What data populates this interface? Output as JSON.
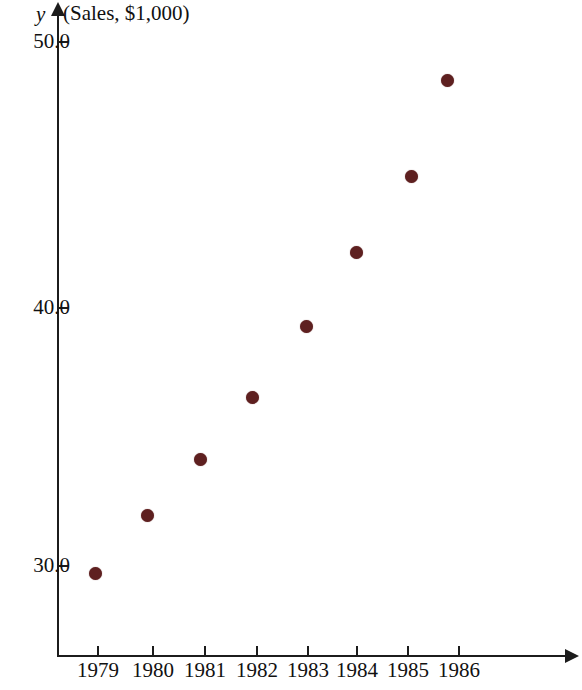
{
  "chart_data": {
    "type": "scatter",
    "title": "",
    "ylabel": "y (Sales, $1,000)",
    "ylabel_symbol": "y",
    "ylabel_text": "(Sales, $1,000)",
    "xlabel": "",
    "categories": [
      "1979",
      "1980",
      "1981",
      "1982",
      "1983",
      "1984",
      "1985",
      "1986"
    ],
    "x": [
      1979,
      1980,
      1981,
      1982,
      1983,
      1984,
      1985,
      1986
    ],
    "values": [
      29.7,
      31.9,
      34.1,
      36.5,
      39.2,
      42.0,
      44.9,
      48.5
    ],
    "series": [
      {
        "name": "Sales",
        "values": [
          29.7,
          31.9,
          34.1,
          36.5,
          39.2,
          42.0,
          44.9,
          48.5
        ]
      }
    ],
    "points": [
      {
        "label": "1979",
        "x": 1979,
        "y": 29.7,
        "px": 95,
        "py": 573
      },
      {
        "label": "1980",
        "x": 1980,
        "y": 31.9,
        "px": 147,
        "py": 515
      },
      {
        "label": "1981",
        "x": 1981,
        "y": 34.1,
        "px": 200,
        "py": 459
      },
      {
        "label": "1982",
        "x": 1982,
        "y": 36.5,
        "px": 252,
        "py": 397
      },
      {
        "label": "1983",
        "x": 1983,
        "y": 39.2,
        "px": 306,
        "py": 326
      },
      {
        "label": "1984",
        "x": 1984,
        "y": 42.0,
        "px": 356,
        "py": 252
      },
      {
        "label": "1985",
        "x": 1985,
        "y": 44.9,
        "px": 411,
        "py": 176
      },
      {
        "label": "1986",
        "x": 1986,
        "y": 48.5,
        "px": 447,
        "py": 80
      }
    ],
    "y_ticks": [
      {
        "label": "50.0",
        "value": 50.0,
        "py": 42
      },
      {
        "label": "40.0",
        "value": 40.0,
        "py": 308
      },
      {
        "label": "30.0",
        "value": 30.0,
        "py": 566
      }
    ],
    "x_ticks": [
      {
        "label": "1979",
        "px": 98
      },
      {
        "label": "1980",
        "px": 153
      },
      {
        "label": "1981",
        "px": 205
      },
      {
        "label": "1982",
        "px": 257
      },
      {
        "label": "1983",
        "px": 308
      },
      {
        "label": "1984",
        "px": 357
      },
      {
        "label": "1985",
        "px": 408
      },
      {
        "label": "1986",
        "px": 459
      }
    ],
    "ylim": [
      26.5,
      51.5
    ],
    "xlim": [
      1978.5,
      1987.5
    ],
    "grid": false,
    "legend": false,
    "marker_color": "#5e2020",
    "axis_color": "#1c1c1c",
    "background_color": "#ffffff"
  }
}
